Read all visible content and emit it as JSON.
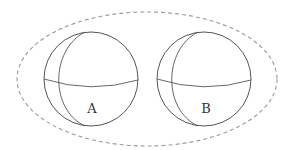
{
  "diagram": {
    "type": "two spheres enclosed in dashed ellipse",
    "colors": {
      "background": "#ffffff",
      "sphere_stroke": "#555555",
      "ellipse_stroke": "#999999",
      "label": "#333333"
    },
    "enclosure": {
      "shape": "ellipse",
      "style": "dashed",
      "cx": 147,
      "cy": 79,
      "rx": 130,
      "ry": 67
    },
    "spheres": [
      {
        "label": "A",
        "cx": 91,
        "cy": 79,
        "r": 47
      },
      {
        "label": "B",
        "cx": 204,
        "cy": 79,
        "r": 47
      }
    ]
  }
}
